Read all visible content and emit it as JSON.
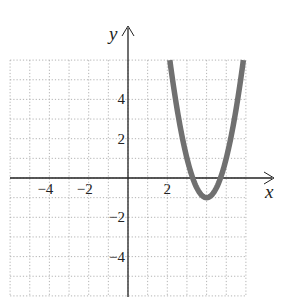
{
  "chart_data": {
    "type": "line",
    "title": "",
    "xlabel": "x",
    "ylabel": "y",
    "xlim": [
      -6,
      6
    ],
    "ylim": [
      -6,
      6
    ],
    "grid": true,
    "grid_style": "dotted",
    "x_tick_labels": [
      "−4",
      "−2",
      "2"
    ],
    "x_ticks": [
      -4,
      -2,
      2
    ],
    "y_tick_labels": [
      "4",
      "2",
      "−2",
      "−4"
    ],
    "y_ticks": [
      4,
      2,
      -2,
      -4
    ],
    "series": [
      {
        "name": "parabola",
        "equation": "y = 2(x − 4)² − 1",
        "color": "#707070",
        "vertex": [
          4,
          -1
        ],
        "x_intercepts": [
          3.29,
          4.71
        ],
        "x": [
          2.13,
          2.5,
          3,
          3.29,
          3.5,
          4,
          4.5,
          4.71,
          5,
          5.5,
          5.87
        ],
        "values": [
          6,
          3.5,
          1,
          0,
          -0.5,
          -1,
          -0.5,
          0,
          1,
          3.5,
          6
        ]
      }
    ],
    "legend": null
  },
  "axes": {
    "x_label": "x",
    "y_label": "y"
  },
  "colors": {
    "curve": "#707070",
    "axis": "#222222",
    "grid": "#aaaaaa"
  }
}
